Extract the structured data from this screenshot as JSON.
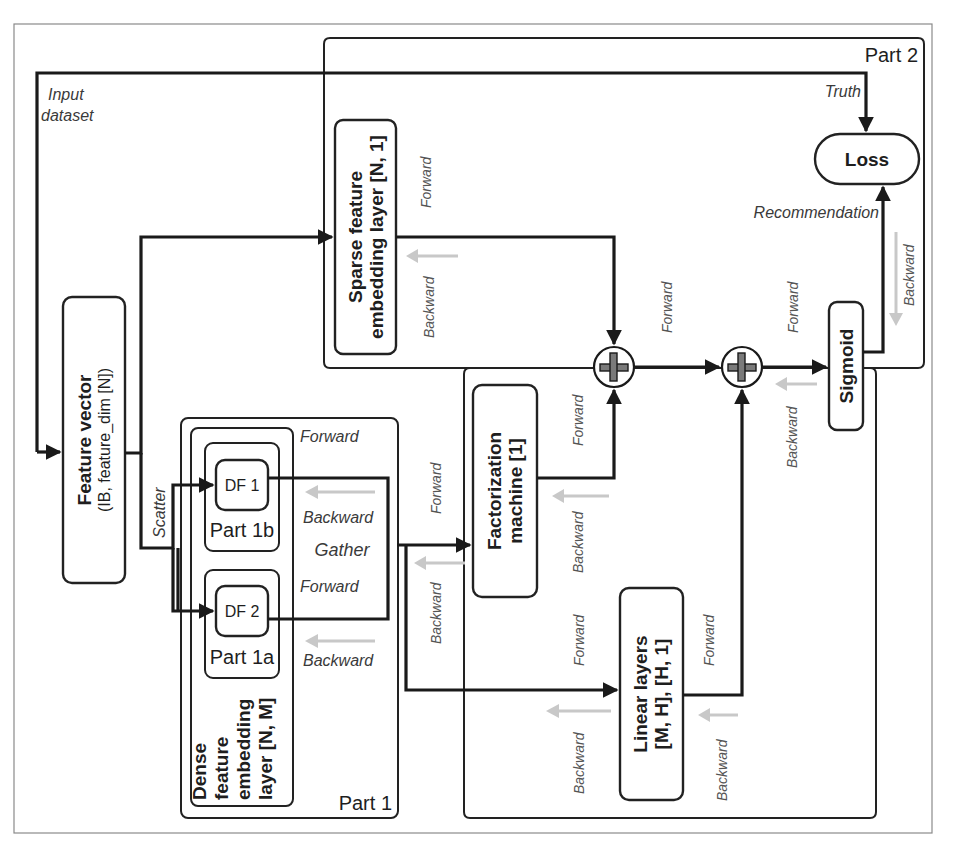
{
  "diagram": {
    "regions": {
      "part1": {
        "label": "Part 1"
      },
      "part1a": {
        "label": "Part 1a"
      },
      "part1b": {
        "label": "Part 1b"
      },
      "part2": {
        "label": "Part 2"
      }
    },
    "nodes": {
      "feature_vector": {
        "line1": "Feature vector",
        "line2": "(IB, feature_dim [N])"
      },
      "sparse_embedding": {
        "line1": "Sparse feature",
        "line2": "embedding layer [N, 1]"
      },
      "dense_embedding": {
        "line1": "Dense",
        "line2": "feature",
        "line3": "embedding",
        "line4": "layer [N, M]"
      },
      "df1": {
        "label": "DF 1"
      },
      "df2": {
        "label": "DF 2"
      },
      "factorization_machine": {
        "line1": "Factorization",
        "line2": "machine [1]"
      },
      "linear_layers": {
        "line1": "Linear layers",
        "line2": "[M, H], [H, 1]"
      },
      "sigmoid": {
        "label": "Sigmoid"
      },
      "loss": {
        "label": "Loss"
      },
      "sum1": {
        "symbol": "plus"
      },
      "sum2": {
        "symbol": "plus"
      }
    },
    "edge_labels": {
      "input_dataset_1": "Input",
      "input_dataset_2": "dataset",
      "truth": "Truth",
      "recommendation": "Recommendation",
      "scatter": "Scatter",
      "gather": "Gather",
      "forward": "Forward",
      "backward": "Backward"
    },
    "edges": [
      {
        "from": "input_dataset",
        "to": "feature_vector",
        "label": "Input dataset"
      },
      {
        "from": "input_dataset",
        "to": "loss",
        "label": "Truth"
      },
      {
        "from": "feature_vector",
        "to": "sparse_embedding"
      },
      {
        "from": "feature_vector",
        "to": "df1",
        "label": "Scatter"
      },
      {
        "from": "feature_vector",
        "to": "df2",
        "label": "Scatter"
      },
      {
        "from": "df1",
        "to": "factorization_machine",
        "label": "Gather"
      },
      {
        "from": "df2",
        "to": "factorization_machine",
        "label": "Gather"
      },
      {
        "from": "gather",
        "to": "linear_layers"
      },
      {
        "from": "sparse_embedding",
        "to": "sum1"
      },
      {
        "from": "factorization_machine",
        "to": "sum1"
      },
      {
        "from": "sum1",
        "to": "sum2"
      },
      {
        "from": "linear_layers",
        "to": "sum2"
      },
      {
        "from": "sum2",
        "to": "sigmoid"
      },
      {
        "from": "sigmoid",
        "to": "loss",
        "label": "Recommendation"
      }
    ]
  }
}
